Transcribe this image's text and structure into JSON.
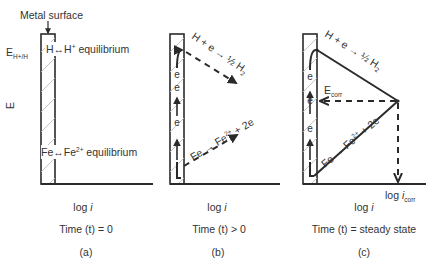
{
  "diagram": {
    "top_label": "Metal surface",
    "y_axis_label": "E",
    "potential_label": {
      "main": "E",
      "sub": "H+/H"
    },
    "panels": [
      {
        "id": "a",
        "x_axis_label": {
          "main": "log ",
          "ital": "i"
        },
        "time_label": "Time (t) = 0",
        "caption": "(a)",
        "upper_equilibrium": {
          "left": "H",
          "arrow": "↔",
          "right": "H",
          "sup": "+",
          "tail": " equilibrium"
        },
        "lower_equilibrium": {
          "left": "Fe",
          "arrow": "↔",
          "right": "Fe",
          "sup": "2+",
          "tail": " equilibrium"
        }
      },
      {
        "id": "b",
        "x_axis_label": {
          "main": "log ",
          "ital": "i"
        },
        "time_label": "Time (t)  > 0",
        "caption": "(b)",
        "cathodic_reaction": "H + e → ½ H",
        "cathodic_sub": "2",
        "anodic_reaction_a": "Fe → Fe",
        "anodic_sup": "2+",
        "anodic_reaction_b": " + 2e",
        "electron": "e"
      },
      {
        "id": "c",
        "x_axis_label": {
          "main": "log ",
          "ital": "i"
        },
        "time_label": "Time (t) = steady state",
        "caption": "(c)",
        "cathodic_reaction": "H + e → ½ H",
        "cathodic_sub": "2",
        "anodic_reaction_a": "Fe → Fe",
        "anodic_sup": "2+",
        "anodic_reaction_b": " + 2e",
        "ecorr": {
          "main": "E",
          "sub": "corr"
        },
        "icorr": {
          "main": "log ",
          "ital": "i",
          "sub": "corr"
        },
        "electron": "e"
      }
    ]
  }
}
